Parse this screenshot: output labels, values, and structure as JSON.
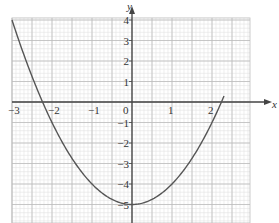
{
  "chart_data": {
    "type": "line",
    "title": "",
    "xlabel": "x",
    "ylabel": "y",
    "xlim": [
      -3,
      3
    ],
    "ylim": [
      -6,
      4
    ],
    "grid": true,
    "x_ticks": [
      "-3",
      "-2",
      "-1",
      "0",
      "1",
      "2"
    ],
    "y_ticks": [
      "4",
      "3",
      "2",
      "1",
      "-1",
      "-2",
      "-3",
      "-4",
      "-5"
    ],
    "series": [
      {
        "name": "y = x^2 - 5",
        "x": [
          -3,
          -2.5,
          -2,
          -1.5,
          -1,
          -0.5,
          0,
          0.5,
          1,
          1.5,
          2,
          2.3
        ],
        "y": [
          4,
          1.25,
          -1,
          -2.75,
          -4,
          -4.75,
          -5,
          -4.75,
          -4,
          -2.75,
          -1,
          0.29
        ]
      }
    ],
    "colors": {
      "curve": "#555555",
      "axis": "#444444",
      "grid_major": "#bdbdbd",
      "grid_minor": "#e2e2e2"
    }
  }
}
